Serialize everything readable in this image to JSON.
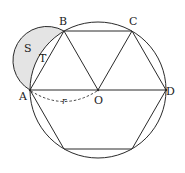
{
  "figure": {
    "center": {
      "label": "O",
      "x": 98,
      "y": 90
    },
    "radius": 68,
    "colors": {
      "stroke": "#2a2a2a",
      "shade": "#e4e4e4",
      "dashed": "#444444"
    },
    "vertices": [
      {
        "label": "A",
        "x": 30,
        "y": 90
      },
      {
        "label": "B",
        "x": 64,
        "y": 31
      },
      {
        "label": "C",
        "x": 132,
        "y": 31
      },
      {
        "label": "D",
        "x": 166,
        "y": 90
      },
      {
        "label": "",
        "x": 132,
        "y": 149
      },
      {
        "label": "",
        "x": 64,
        "y": 149
      }
    ],
    "labels": {
      "A": "A",
      "B": "B",
      "C": "C",
      "D": "D",
      "O": "O",
      "S": "S",
      "T": "T",
      "r": "r"
    },
    "regions": [
      {
        "name": "S",
        "description": "lune between semicircle on AB and arc AB",
        "shaded": true
      },
      {
        "name": "T",
        "description": "segment between chord AB and arc AB",
        "shaded": false
      }
    ],
    "annotations": [
      {
        "type": "dashed-arc",
        "from": "A",
        "to": "O",
        "label": "r"
      }
    ]
  }
}
